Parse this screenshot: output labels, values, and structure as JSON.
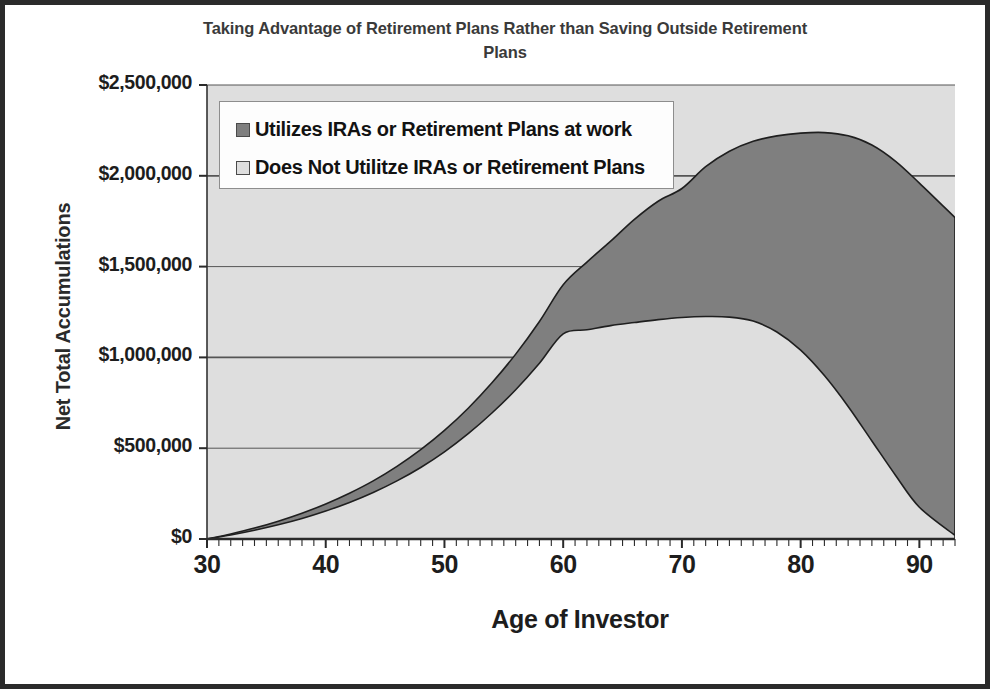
{
  "chart_data": {
    "type": "area",
    "title": "Taking Advantage of Retirement Plans Rather than Saving Outside Retirement Plans",
    "xlabel": "Age of Investor",
    "ylabel": "Net Total Accumulations",
    "xlim": [
      30,
      93
    ],
    "ylim": [
      0,
      2500000
    ],
    "xticks": [
      30,
      40,
      50,
      60,
      70,
      80,
      90
    ],
    "xtick_labels": [
      "30",
      "40",
      "50",
      "60",
      "70",
      "80",
      "90"
    ],
    "minor_xtick_interval": 1,
    "yticks": [
      0,
      500000,
      1000000,
      1500000,
      2000000,
      2500000
    ],
    "ytick_labels": [
      "$0",
      "$500,000",
      "$1,000,000",
      "$1,500,000",
      "$2,000,000",
      "$2,500,000"
    ],
    "grid": "horizontal",
    "legend_position": "top-left-inside",
    "stacked": false,
    "colors": {
      "series_dark": "#7f7f7f",
      "series_light": "#dedede",
      "plot_background": "#dedede",
      "axis_line": "#333333",
      "gridline": "#555555",
      "figure_border": "#2b2b2b",
      "title_text": "#3a3a3a",
      "tick_text": "#1d1d1d"
    },
    "x": [
      30,
      32,
      34,
      36,
      38,
      40,
      42,
      44,
      46,
      48,
      50,
      52,
      54,
      56,
      58,
      60,
      62,
      64,
      66,
      68,
      70,
      72,
      74,
      76,
      78,
      80,
      82,
      84,
      86,
      88,
      90,
      93
    ],
    "series": [
      {
        "name": "Utilizes IRAs or Retirement Plans at work",
        "swatch": "dark",
        "values": [
          0,
          28000,
          60000,
          98000,
          142000,
          193000,
          252000,
          320000,
          400000,
          492000,
          598000,
          720000,
          860000,
          1018000,
          1198000,
          1400000,
          1525000,
          1640000,
          1760000,
          1860000,
          1930000,
          2050000,
          2135000,
          2190000,
          2220000,
          2235000,
          2238000,
          2220000,
          2170000,
          2080000,
          1960000,
          1770000
        ]
      },
      {
        "name": "Does Not Utilitze IRAs or Retirement Plans",
        "swatch": "light",
        "values": [
          0,
          22000,
          48000,
          78000,
          113000,
          154000,
          201000,
          256000,
          320000,
          394000,
          480000,
          580000,
          694000,
          822000,
          968000,
          1130000,
          1152000,
          1175000,
          1192000,
          1208000,
          1220000,
          1225000,
          1222000,
          1200000,
          1140000,
          1040000,
          900000,
          730000,
          540000,
          350000,
          175000,
          20000
        ]
      }
    ]
  },
  "legend": {
    "items": [
      {
        "label": "Utilizes IRAs or Retirement Plans at work",
        "swatch": "dark"
      },
      {
        "label": "Does Not Utilitze IRAs or Retirement Plans",
        "swatch": "light"
      }
    ]
  }
}
